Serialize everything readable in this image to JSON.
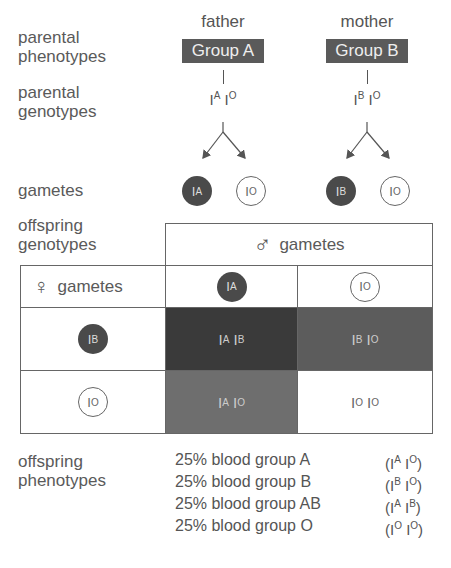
{
  "labels": {
    "parental_phenotypes": [
      "parental",
      "phenotypes"
    ],
    "parental_genotypes": [
      "parental",
      "genotypes"
    ],
    "gametes": "gametes",
    "offspring_genotypes": [
      "offspring",
      "genotypes"
    ],
    "offspring_phenotypes": [
      "offspring",
      "phenotypes"
    ]
  },
  "parents": [
    {
      "role": "father",
      "phenotype": "Group A",
      "genotype": {
        "a1": "A",
        "a2": "O"
      }
    },
    {
      "role": "mother",
      "phenotype": "Group B",
      "genotype": {
        "a1": "B",
        "a2": "O"
      }
    }
  ],
  "gametes": {
    "father": [
      {
        "allele": "A",
        "filled": true
      },
      {
        "allele": "O",
        "filled": false
      }
    ],
    "mother": [
      {
        "allele": "B",
        "filled": true
      },
      {
        "allele": "O",
        "filled": false
      }
    ]
  },
  "punnett": {
    "male_header": "gametes",
    "male_symbol": "♂",
    "female_header": "gametes",
    "female_symbol": "♀",
    "columns": [
      {
        "allele": "A",
        "filled": true
      },
      {
        "allele": "O",
        "filled": false
      }
    ],
    "rows": [
      {
        "allele": "B",
        "filled": true,
        "cells": [
          {
            "a1": "A",
            "a2": "B",
            "color": "#3a3a3a"
          },
          {
            "a1": "B",
            "a2": "O",
            "color": "#5c5c5c"
          }
        ]
      },
      {
        "allele": "O",
        "filled": false,
        "cells": [
          {
            "a1": "A",
            "a2": "O",
            "color": "#6e6e6e"
          },
          {
            "a1": "O",
            "a2": "O",
            "color": "#ffffff"
          }
        ]
      }
    ]
  },
  "offspring_phenotypes": [
    {
      "text": "25% blood group A",
      "a1": "A",
      "a2": "O"
    },
    {
      "text": "25% blood group B",
      "a1": "B",
      "a2": "O"
    },
    {
      "text": "25% blood group AB",
      "a1": "A",
      "a2": "B"
    },
    {
      "text": "25% blood group O",
      "a1": "O",
      "a2": "O"
    }
  ],
  "allele_base": "I"
}
